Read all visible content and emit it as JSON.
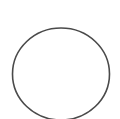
{
  "shape": {
    "type": "circle",
    "cx": 61,
    "cy": 74,
    "rx": 48.5,
    "ry": 46,
    "stroke_color": "#4a4a4a",
    "stroke_width": 1.6,
    "fill_color": "#ffffff"
  },
  "background_color": "#ffffff"
}
